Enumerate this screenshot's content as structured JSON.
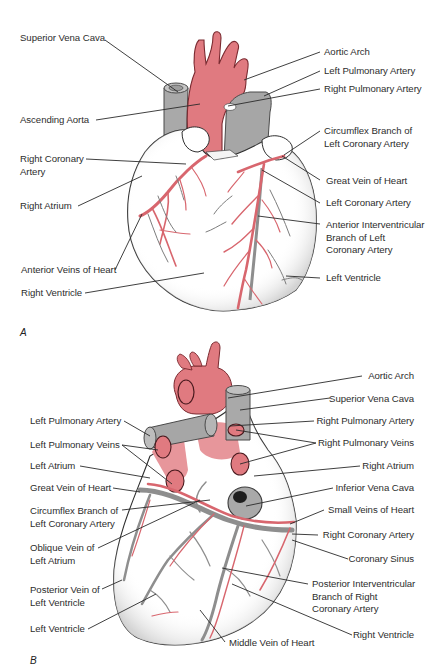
{
  "figure": {
    "colors": {
      "artery": "#e07a80",
      "artery_outline": "#8a2a30",
      "vein": "#a9a9a9",
      "vein_outline": "#5a5a5a",
      "heart_fill": "#ffffff",
      "stipple": "#bdbdbd",
      "leader_line": "#2a2a2a",
      "text": "#2d2d2d"
    },
    "panels": [
      {
        "id": "A",
        "letter": "A",
        "view": "anterior",
        "labels_left": [
          "Superior Vena Cava",
          "Ascending Aorta",
          "Right Coronary\nArtery",
          "Right Atrium",
          "Anterior Veins of Heart",
          "Right Ventricle"
        ],
        "labels_right": [
          "Aortic Arch",
          "Left Pulmonary Artery",
          "Right Pulmonary Artery",
          "Circumflex Branch of\nLeft Coronary Artery",
          "Great Vein of Heart",
          "Left Coronary Artery",
          "Anterior Interventricular\nBranch of Left\nCoronary Artery",
          "Left Ventricle"
        ]
      },
      {
        "id": "B",
        "letter": "B",
        "view": "posterior",
        "labels_left": [
          "Left Pulmonary Artery",
          "Left Pulmonary Veins",
          "Left Atrium",
          "Great Vein of Heart",
          "Circumflex Branch of\nLeft Coronary Artery",
          "Oblique Vein of\nLeft Atrium",
          "Posterior Vein of\nLeft Ventricle",
          "Left Ventricle"
        ],
        "labels_right": [
          "Aortic Arch",
          "Superior Vena Cava",
          "Right Pulmonary Artery",
          "Right Pulmonary Veins",
          "Right Atrium",
          "Inferior Vena Cava",
          "Small Veins of Heart",
          "Right Coronary Artery",
          "Coronary Sinus",
          "Posterior Interventricular\nBranch of Right\nCoronary Artery",
          "Right Ventricle"
        ],
        "labels_bottom": [
          "Middle Vein of Heart"
        ]
      }
    ]
  }
}
